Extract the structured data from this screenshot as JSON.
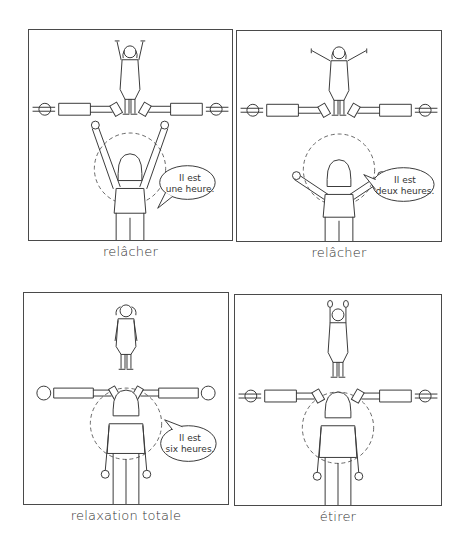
{
  "panels": [
    {
      "id": "panel-1",
      "caption": "relâcher",
      "speech": {
        "line1": "Il est",
        "line2": "une heure."
      },
      "pose": "arms-up",
      "top_child_pose": "arms-up"
    },
    {
      "id": "panel-2",
      "caption": "relâcher",
      "speech": {
        "line1": "Il est",
        "line2": "deux heures."
      },
      "pose": "arms-diagonal",
      "top_child_pose": "arms-diagonal"
    },
    {
      "id": "panel-3",
      "caption": "relaxation totale",
      "speech": {
        "line1": "Il est",
        "line2": "six heures."
      },
      "pose": "arms-down",
      "top_child_pose": "arms-down"
    },
    {
      "id": "panel-4",
      "caption": "étirer",
      "speech": null,
      "pose": "arms-down",
      "top_child_pose": "arms-up"
    }
  ],
  "colors": {
    "line": "#3a3a3a",
    "border": "#4a4a4a",
    "background": "#ffffff"
  }
}
